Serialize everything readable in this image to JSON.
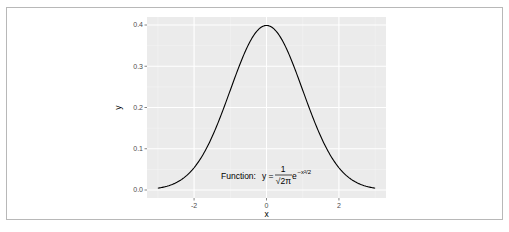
{
  "chart_data": {
    "type": "line",
    "title": "",
    "xlabel": "x",
    "ylabel": "y",
    "xlim": [
      -3.3,
      3.3
    ],
    "ylim": [
      -0.02,
      0.42
    ],
    "x_ticks": [
      -2,
      0,
      2
    ],
    "x_tick_labels": [
      "-2",
      "0",
      "2"
    ],
    "y_ticks": [
      0.0,
      0.1,
      0.2,
      0.3,
      0.4
    ],
    "y_tick_labels": [
      "0.0",
      "0.1",
      "0.2",
      "0.3",
      "0.4"
    ],
    "grid": true,
    "legend": "none",
    "series": [
      {
        "name": "dnorm(x)",
        "function": "standard normal density",
        "x": [
          -3,
          -2.5,
          -2,
          -1.5,
          -1,
          -0.5,
          0,
          0.5,
          1,
          1.5,
          2,
          2.5,
          3
        ],
        "values": [
          0.0044,
          0.0175,
          0.054,
          0.1295,
          0.242,
          0.3521,
          0.3989,
          0.3521,
          0.242,
          0.1295,
          0.054,
          0.0175,
          0.0044
        ],
        "color": "#000000"
      }
    ],
    "annotation": {
      "prefix": "Function:",
      "lhs": "y =",
      "numerator": "1",
      "denominator": "√2π",
      "exp_base": "e",
      "exponent": "−x²/2",
      "x": 0,
      "y": 0.04
    },
    "colors": {
      "panel_bg": "#ebebeb",
      "grid_major": "#ffffff",
      "grid_minor": "#f5f5f5",
      "line": "#000000"
    }
  }
}
